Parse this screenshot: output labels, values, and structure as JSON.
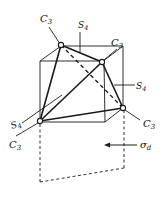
{
  "figure": {
    "labels": {
      "c3_top": "C",
      "c3_top_sub": "3",
      "c3_right_top": "C",
      "c3_right_top_sub": "3",
      "c3_right_bottom": "C",
      "c3_right_bottom_sub": "3",
      "c3_bottom_left": "C",
      "c3_bottom_left_sub": "3",
      "s4_top": "S",
      "s4_top_sub": "4",
      "s4_right": "S",
      "s4_right_sub": "4",
      "s4_left": "S",
      "s4_left_sub": "4",
      "sigma_d": "σ",
      "sigma_d_sub": "d"
    },
    "colors": {
      "line": "#1a1a1a",
      "background": "#ffffff"
    }
  }
}
